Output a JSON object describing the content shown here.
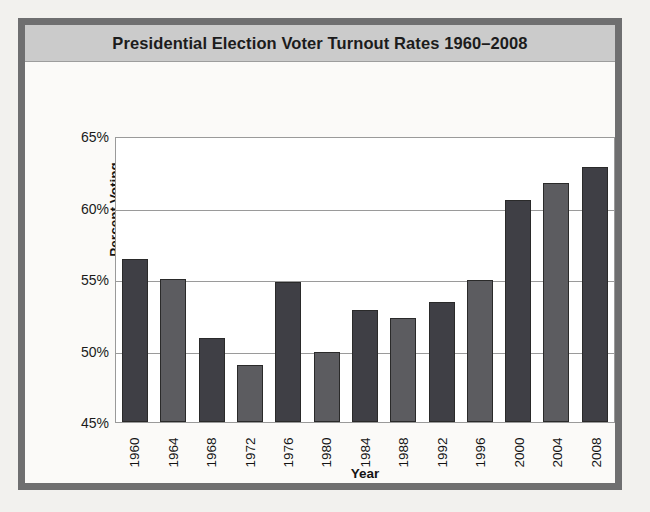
{
  "chart_data": {
    "type": "bar",
    "title": "Presidential Election Voter Turnout Rates 1960–2008",
    "xlabel": "Year",
    "ylabel": "Percent Voting",
    "ylim": [
      45,
      65
    ],
    "ytick_step": 5,
    "ytick_labels": [
      "65%",
      "60%",
      "55%",
      "50%",
      "45%"
    ],
    "ytick_values": [
      65,
      60,
      55,
      50,
      45
    ],
    "grid": true,
    "legend": "none",
    "categories": [
      "1960",
      "1964",
      "1968",
      "1972",
      "1976",
      "1980",
      "1984",
      "1988",
      "1992",
      "1996",
      "2000",
      "2004",
      "2008"
    ],
    "values": [
      56.4,
      55.0,
      50.9,
      49.0,
      54.8,
      49.9,
      52.8,
      52.3,
      53.4,
      54.9,
      60.5,
      61.7,
      62.8
    ],
    "bar_colors": [
      "#3f3f45",
      "#5c5c60",
      "#3f3f45",
      "#5c5c60",
      "#3f3f45",
      "#5c5c60",
      "#3f3f45",
      "#5c5c60",
      "#3f3f45",
      "#5c5c60",
      "#3f3f45",
      "#5c5c60",
      "#3f3f45"
    ]
  },
  "figure": {
    "frame_color": "#6f6f70",
    "title_band_color": "#cbcbcb",
    "plot_background": "#ffffff",
    "page_background": "#f2f1ee"
  }
}
